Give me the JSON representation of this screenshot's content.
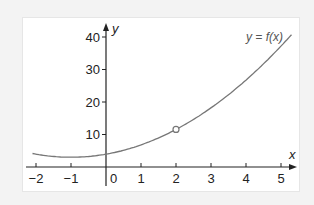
{
  "chart_data": {
    "type": "line",
    "title": "",
    "function_label": "y = f(x)",
    "xlabel": "x",
    "ylabel": "y",
    "x_ticks": [
      -2,
      -1,
      0,
      1,
      2,
      3,
      4,
      5
    ],
    "y_ticks": [
      10,
      20,
      30,
      40
    ],
    "xlim": [
      -2.1,
      5.3
    ],
    "ylim": [
      0,
      42
    ],
    "grid": false,
    "legend": "none",
    "series": [
      {
        "name": "f(x)",
        "x": [
          -2.1,
          -2,
          -1.5,
          -1,
          -0.5,
          0,
          0.5,
          1,
          1.5,
          2,
          2.5,
          3,
          3.5,
          4,
          4.5,
          5,
          5.3
        ],
        "values": [
          4.1,
          3.95,
          3.2,
          3.0,
          3.2,
          3.95,
          5.1,
          6.8,
          8.9,
          11.55,
          14.6,
          18.2,
          22.2,
          26.75,
          31.7,
          37.2,
          40.7
        ]
      }
    ],
    "highlighted_point": {
      "x": 2,
      "y": 12,
      "marker": "open-circle"
    },
    "colors": {
      "curve": "#777777",
      "axes": "#222222",
      "marker": "#777777"
    }
  }
}
